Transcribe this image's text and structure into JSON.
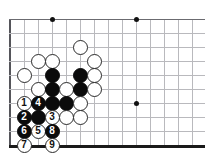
{
  "board": {
    "title": "Go board diagram",
    "colors": {
      "grid_line": "#b9b9bd",
      "edge_line": "#55555a",
      "bottom_edge": "#1a1a1a",
      "black_stone": "#0b0b0b",
      "white_stone": "#ffffff",
      "star_point": "#111111",
      "background": "#ffffff"
    },
    "geometry": {
      "cell": 14,
      "origin_x": 10,
      "origin_y": 19,
      "cols": 14,
      "rows": 10,
      "stone_size": 15
    },
    "star_points": [
      {
        "x": 52,
        "y": 19
      },
      {
        "x": 136,
        "y": 19
      },
      {
        "x": 136,
        "y": 103
      }
    ],
    "stones": [
      {
        "name": "white-stone-f4",
        "color": "white",
        "label": "",
        "x": 80,
        "y": 47
      },
      {
        "name": "white-stone-c5",
        "color": "white",
        "label": "",
        "x": 38,
        "y": 61
      },
      {
        "name": "white-stone-d5",
        "color": "white",
        "label": "",
        "x": 52,
        "y": 61
      },
      {
        "name": "white-stone-g5",
        "color": "white",
        "label": "",
        "x": 94,
        "y": 61
      },
      {
        "name": "white-stone-b6",
        "color": "white",
        "label": "",
        "x": 24,
        "y": 75
      },
      {
        "name": "black-stone-d6",
        "color": "black",
        "label": "",
        "x": 52,
        "y": 75
      },
      {
        "name": "black-stone-f6",
        "color": "black",
        "label": "",
        "x": 80,
        "y": 75
      },
      {
        "name": "white-stone-g6",
        "color": "white",
        "label": "",
        "x": 94,
        "y": 75
      },
      {
        "name": "white-stone-c7",
        "color": "white",
        "label": "",
        "x": 38,
        "y": 89
      },
      {
        "name": "black-stone-d7",
        "color": "black",
        "label": "",
        "x": 52,
        "y": 89
      },
      {
        "name": "white-stone-e7",
        "color": "white",
        "label": "",
        "x": 66,
        "y": 89
      },
      {
        "name": "black-stone-f7",
        "color": "black",
        "label": "",
        "x": 80,
        "y": 89
      },
      {
        "name": "white-stone-g7",
        "color": "white",
        "label": "",
        "x": 94,
        "y": 89
      },
      {
        "name": "move-1-white",
        "color": "white",
        "label": "1",
        "x": 24,
        "y": 103
      },
      {
        "name": "move-4-black",
        "color": "black",
        "label": "4",
        "x": 38,
        "y": 103
      },
      {
        "name": "black-stone-d8",
        "color": "black",
        "label": "",
        "x": 52,
        "y": 103
      },
      {
        "name": "black-stone-e8",
        "color": "black",
        "label": "",
        "x": 66,
        "y": 103
      },
      {
        "name": "white-stone-f8",
        "color": "white",
        "label": "",
        "x": 80,
        "y": 103
      },
      {
        "name": "move-2-black",
        "color": "black",
        "label": "2",
        "x": 24,
        "y": 117
      },
      {
        "name": "black-stone-c9",
        "color": "black",
        "label": "",
        "x": 38,
        "y": 117
      },
      {
        "name": "move-3-white",
        "color": "white",
        "label": "3",
        "x": 52,
        "y": 117
      },
      {
        "name": "white-stone-e9",
        "color": "white",
        "label": "",
        "x": 66,
        "y": 117
      },
      {
        "name": "white-stone-f9",
        "color": "white",
        "label": "",
        "x": 80,
        "y": 117
      },
      {
        "name": "move-6-black",
        "color": "black",
        "label": "6",
        "x": 24,
        "y": 131
      },
      {
        "name": "move-5-white",
        "color": "white",
        "label": "5",
        "x": 38,
        "y": 131
      },
      {
        "name": "move-8-black",
        "color": "black",
        "label": "8",
        "x": 52,
        "y": 131
      },
      {
        "name": "move-7-white",
        "color": "white",
        "label": "7",
        "x": 24,
        "y": 145
      },
      {
        "name": "move-9-white",
        "color": "white",
        "label": "9",
        "x": 52,
        "y": 145
      }
    ]
  }
}
